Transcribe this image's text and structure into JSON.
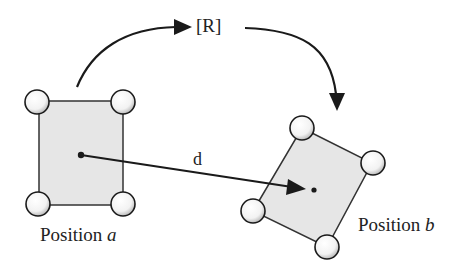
{
  "diagram": {
    "rotation_label": "[R]",
    "displacement_label": "d",
    "position_a": {
      "prefix": "Position ",
      "var": "a"
    },
    "position_b": {
      "prefix": "Position ",
      "var": "b"
    }
  },
  "colors": {
    "stroke": "#1a1a1a",
    "fill": "#e6e6e6",
    "joint_fill": "#ffffff"
  }
}
